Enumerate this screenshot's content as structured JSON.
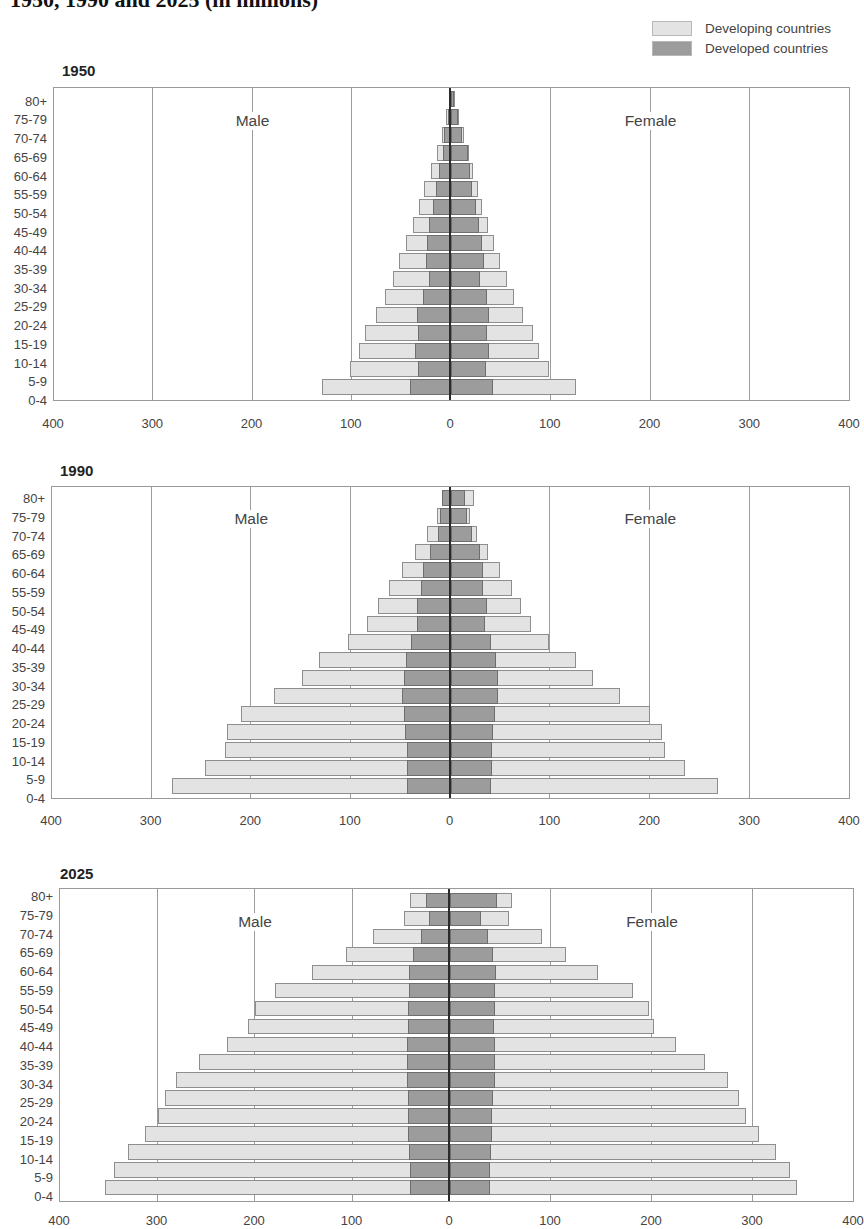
{
  "title": "1950, 1990 and 2025 (in millions)",
  "legend": [
    {
      "label": "Developing countries",
      "color": "#e3e3e3"
    },
    {
      "label": "Developed countries",
      "color": "#9c9c9c"
    }
  ],
  "labels": {
    "male": "Male",
    "female": "Female"
  },
  "age_groups": [
    "80+",
    "75-79",
    "70-74",
    "65-69",
    "60-64",
    "55-59",
    "50-54",
    "45-49",
    "40-44",
    "35-39",
    "30-34",
    "25-29",
    "20-24",
    "15-19",
    "10-14",
    "5-9",
    "0-4"
  ],
  "x_ticks": [
    "400",
    "300",
    "200",
    "100",
    "0",
    "100",
    "200",
    "300",
    "400"
  ],
  "chart_data": [
    {
      "type": "bar",
      "subtype": "population-pyramid (stacked, horizontal)",
      "title": "1950",
      "xlabel": "",
      "ylabel": "",
      "xlim": [
        -400,
        400
      ],
      "x_tick_values": [
        -400,
        -300,
        -200,
        -100,
        0,
        100,
        200,
        300,
        400
      ],
      "x_tick_labels": [
        "400",
        "300",
        "200",
        "100",
        "0",
        "100",
        "200",
        "300",
        "400"
      ],
      "grid": true,
      "legend_position": "top-right",
      "categories": [
        "80+",
        "75-79",
        "70-74",
        "65-69",
        "60-64",
        "55-59",
        "50-54",
        "45-49",
        "40-44",
        "35-39",
        "30-34",
        "25-29",
        "20-24",
        "15-19",
        "10-14",
        "5-9",
        "0-4"
      ],
      "annotations": [
        "Male",
        "Female"
      ],
      "series": [
        {
          "name": "Male - Developed countries",
          "values": [
            1,
            3,
            7,
            8,
            12,
            15,
            18,
            22,
            24,
            25,
            22,
            28,
            34,
            33,
            36,
            33,
            41
          ]
        },
        {
          "name": "Male - Total (Developing + Developed)",
          "values": [
            2,
            5,
            9,
            14,
            20,
            27,
            32,
            38,
            45,
            52,
            58,
            66,
            76,
            87,
            93,
            102,
            130
          ]
        },
        {
          "name": "Female - Developed countries",
          "values": [
            3,
            7,
            11,
            17,
            19,
            21,
            25,
            28,
            31,
            33,
            29,
            36,
            38,
            36,
            38,
            35,
            42
          ]
        },
        {
          "name": "Female - Total (Developing + Developed)",
          "values": [
            4,
            8,
            13,
            18,
            22,
            27,
            31,
            37,
            43,
            49,
            56,
            63,
            72,
            82,
            88,
            98,
            125
          ]
        }
      ]
    },
    {
      "type": "bar",
      "subtype": "population-pyramid (stacked, horizontal)",
      "title": "1990",
      "xlabel": "",
      "ylabel": "",
      "xlim": [
        -400,
        400
      ],
      "x_tick_values": [
        -400,
        -300,
        -200,
        -100,
        0,
        100,
        200,
        300,
        400
      ],
      "x_tick_labels": [
        "400",
        "300",
        "200",
        "100",
        "0",
        "100",
        "200",
        "300",
        "400"
      ],
      "grid": true,
      "categories": [
        "80+",
        "75-79",
        "70-74",
        "65-69",
        "60-64",
        "55-59",
        "50-54",
        "45-49",
        "40-44",
        "35-39",
        "30-34",
        "25-29",
        "20-24",
        "15-19",
        "10-14",
        "5-9",
        "0-4"
      ],
      "annotations": [
        "Male",
        "Female"
      ],
      "series": [
        {
          "name": "Male - Developed countries",
          "values": [
            9,
            11,
            13,
            21,
            28,
            30,
            34,
            34,
            40,
            45,
            47,
            49,
            47,
            46,
            44,
            44,
            44
          ]
        },
        {
          "name": "Male - Total (Developing + Developed)",
          "values": [
            9,
            14,
            24,
            36,
            49,
            62,
            73,
            84,
            103,
            132,
            149,
            177,
            210,
            224,
            226,
            246,
            280
          ]
        },
        {
          "name": "Female - Developed countries",
          "values": [
            15,
            17,
            22,
            30,
            33,
            33,
            37,
            35,
            41,
            46,
            48,
            48,
            45,
            43,
            42,
            42,
            41
          ]
        },
        {
          "name": "Female - Total (Developing + Developed)",
          "values": [
            24,
            20,
            27,
            38,
            50,
            62,
            71,
            81,
            99,
            126,
            143,
            170,
            200,
            212,
            215,
            235,
            268
          ]
        }
      ]
    },
    {
      "type": "bar",
      "subtype": "population-pyramid (stacked, horizontal)",
      "title": "2025",
      "xlabel": "",
      "ylabel": "",
      "xlim": [
        -400,
        400
      ],
      "x_tick_values": [
        -400,
        -300,
        -200,
        -100,
        0,
        100,
        200,
        300,
        400
      ],
      "x_tick_labels": [
        "400",
        "300",
        "200",
        "100",
        "0",
        "100",
        "200",
        "300",
        "400"
      ],
      "grid": true,
      "categories": [
        "80+",
        "75-79",
        "70-74",
        "65-69",
        "60-64",
        "55-59",
        "50-54",
        "45-49",
        "40-44",
        "35-39",
        "30-34",
        "25-29",
        "20-24",
        "15-19",
        "10-14",
        "5-9",
        "0-4"
      ],
      "annotations": [
        "Male",
        "Female"
      ],
      "series": [
        {
          "name": "Male - Developed countries",
          "values": [
            25,
            22,
            30,
            38,
            42,
            42,
            43,
            43,
            44,
            44,
            44,
            43,
            43,
            43,
            42,
            41,
            41
          ]
        },
        {
          "name": "Male - Total (Developing + Developed)",
          "values": [
            41,
            47,
            79,
            107,
            142,
            180,
            200,
            207,
            229,
            257,
            281,
            292,
            300,
            313,
            330,
            345,
            354
          ]
        },
        {
          "name": "Female - Developed countries",
          "values": [
            47,
            31,
            38,
            43,
            46,
            45,
            45,
            44,
            45,
            45,
            45,
            43,
            42,
            42,
            41,
            40,
            40
          ]
        },
        {
          "name": "Female - Total (Developing + Developed)",
          "values": [
            61,
            58,
            91,
            115,
            147,
            181,
            197,
            202,
            224,
            252,
            275,
            286,
            293,
            306,
            323,
            337,
            344
          ]
        }
      ]
    }
  ]
}
